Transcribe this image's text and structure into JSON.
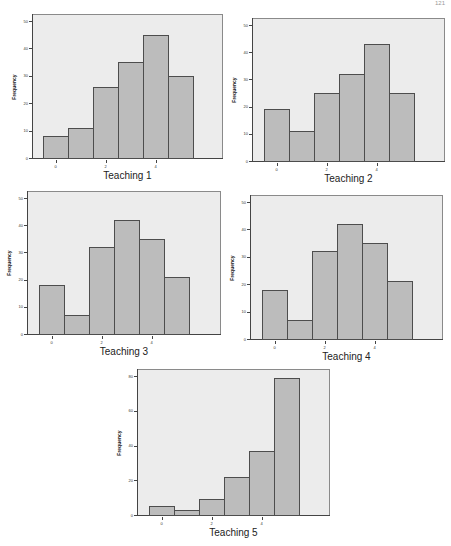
{
  "page": {
    "page_number": "121"
  },
  "style": {
    "plot_bg": "#ececec",
    "bar_fill": "#bcbcbc",
    "bar_edge": "#4d4d4d"
  },
  "chart_data": [
    {
      "type": "bar",
      "title": "Teaching 1",
      "xlabel": "Teaching 1",
      "ylabel": "Frequency",
      "categories": [
        "0",
        "1",
        "2",
        "3",
        "4",
        "5"
      ],
      "values": [
        8,
        11,
        26,
        35,
        45,
        30
      ],
      "x_ticks": [
        "0",
        "2",
        "4"
      ],
      "y_ticks": [
        "0",
        "10",
        "20",
        "30",
        "40",
        "50"
      ],
      "ylim": [
        0,
        50
      ],
      "grid": false
    },
    {
      "type": "bar",
      "title": "Teaching 2",
      "xlabel": "Teaching 2",
      "ylabel": "Frequency",
      "categories": [
        "0",
        "1",
        "2",
        "3",
        "4",
        "5"
      ],
      "values": [
        19,
        11,
        25,
        32,
        43,
        25
      ],
      "x_ticks": [
        "0",
        "2",
        "4"
      ],
      "y_ticks": [
        "0",
        "10",
        "20",
        "30",
        "40",
        "50"
      ],
      "ylim": [
        0,
        50
      ],
      "grid": false
    },
    {
      "type": "bar",
      "title": "Teaching 3",
      "xlabel": "Teaching 3",
      "ylabel": "Frequency",
      "categories": [
        "0",
        "1",
        "2",
        "3",
        "4",
        "5"
      ],
      "values": [
        18,
        7,
        32,
        42,
        35,
        21
      ],
      "x_ticks": [
        "0",
        "2",
        "4"
      ],
      "y_ticks": [
        "0",
        "10",
        "20",
        "30",
        "40",
        "50"
      ],
      "ylim": [
        0,
        50
      ],
      "grid": false
    },
    {
      "type": "bar",
      "title": "Teaching 4",
      "xlabel": "Teaching 4",
      "ylabel": "Frequency",
      "categories": [
        "0",
        "1",
        "2",
        "3",
        "4",
        "5"
      ],
      "values": [
        18,
        7,
        32,
        42,
        35,
        21
      ],
      "x_ticks": [
        "0",
        "2",
        "4"
      ],
      "y_ticks": [
        "0",
        "10",
        "20",
        "30",
        "40",
        "50"
      ],
      "ylim": [
        0,
        50
      ],
      "grid": false
    },
    {
      "type": "bar",
      "title": "Teaching 5",
      "xlabel": "Teaching 5",
      "ylabel": "Frequency",
      "categories": [
        "0",
        "1",
        "2",
        "3",
        "4",
        "5"
      ],
      "values": [
        5,
        3,
        9,
        22,
        37,
        79
      ],
      "x_ticks": [
        "0",
        "2",
        "4"
      ],
      "y_ticks": [
        "0",
        "20",
        "40",
        "60",
        "80"
      ],
      "ylim": [
        0,
        80
      ],
      "grid": false
    }
  ],
  "layout": [
    {
      "fx": 32,
      "fy": 14,
      "fw": 191,
      "fh": 145
    },
    {
      "fx": 252,
      "fy": 18,
      "fw": 193,
      "fh": 144
    },
    {
      "fx": 27,
      "fy": 191,
      "fw": 194,
      "fh": 144
    },
    {
      "fx": 250,
      "fy": 195,
      "fw": 193,
      "fh": 145
    },
    {
      "fx": 137,
      "fy": 369,
      "fw": 193,
      "fh": 147
    }
  ]
}
